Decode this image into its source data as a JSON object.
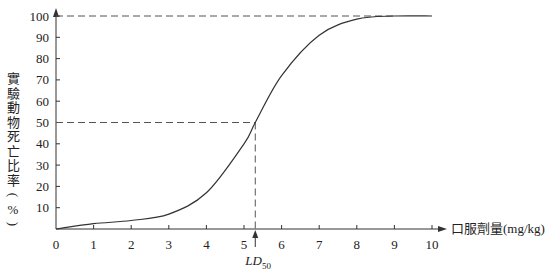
{
  "chart_data": {
    "type": "line",
    "title": "",
    "xlabel": "口服劑量(mg/kg)",
    "ylabel": "實驗動物死亡比率(%)",
    "xlim": [
      0,
      10
    ],
    "ylim": [
      0,
      100
    ],
    "x_ticks": [
      "0",
      "1",
      "2",
      "3",
      "4",
      "5",
      "6",
      "7",
      "8",
      "9",
      "10"
    ],
    "y_ticks": [
      "10",
      "20",
      "30",
      "40",
      "50",
      "60",
      "70",
      "80",
      "90",
      "100"
    ],
    "grid": false,
    "legend": null,
    "series": [
      {
        "name": "dose-response curve",
        "x": [
          0,
          1,
          2,
          3,
          4,
          5,
          5.3,
          6,
          7,
          8,
          9,
          10
        ],
        "y": [
          0,
          2.5,
          4,
          7,
          17,
          40,
          50,
          72,
          91,
          98.5,
          100,
          100
        ]
      }
    ],
    "annotations": [
      {
        "type": "dashed-hline",
        "y": 100,
        "x_from": 0,
        "x_to": 9
      },
      {
        "type": "dashed-hline",
        "y": 50,
        "x_from": 0,
        "x_to": 5.3
      },
      {
        "type": "dashed-vline",
        "x": 5.3,
        "y_from": 0,
        "y_to": 50
      },
      {
        "type": "arrow-label",
        "x": 5.3,
        "label": "LD",
        "subscript": "50"
      }
    ]
  },
  "labels": {
    "xlabel": "口服劑量(mg/kg)",
    "ylabel_chars": [
      "實",
      "驗",
      "動",
      "物",
      "死",
      "亡",
      "比",
      "率",
      "(",
      "%",
      ")"
    ],
    "ld_main": "LD",
    "ld_sub": "50"
  }
}
